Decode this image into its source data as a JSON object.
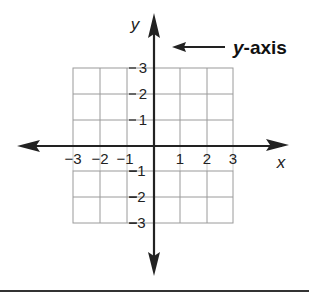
{
  "diagram": {
    "axis_labels": {
      "x": "x",
      "y": "y"
    },
    "x_ticks": [
      {
        "value": -3,
        "label": "−3"
      },
      {
        "value": -2,
        "label": "−2"
      },
      {
        "value": -1,
        "label": "−1"
      },
      {
        "value": 1,
        "label": "1"
      },
      {
        "value": 2,
        "label": "2"
      },
      {
        "value": 3,
        "label": "3"
      }
    ],
    "y_ticks": [
      {
        "value": 3,
        "label": "3"
      },
      {
        "value": 2,
        "label": "2"
      },
      {
        "value": 1,
        "label": "1"
      },
      {
        "value": -1,
        "label": "−1"
      },
      {
        "value": -2,
        "label": "−2"
      },
      {
        "value": -3,
        "label": "−3"
      }
    ],
    "callout": {
      "italic_part": "y",
      "rest": "-axis",
      "points_to": "y-axis"
    },
    "grid": {
      "x_range": [
        -3,
        3
      ],
      "y_range": [
        -3,
        3
      ],
      "cell_size": 1
    },
    "colors": {
      "axis": "#222222",
      "grid": "#9a9a9a",
      "text": "#222222"
    }
  }
}
